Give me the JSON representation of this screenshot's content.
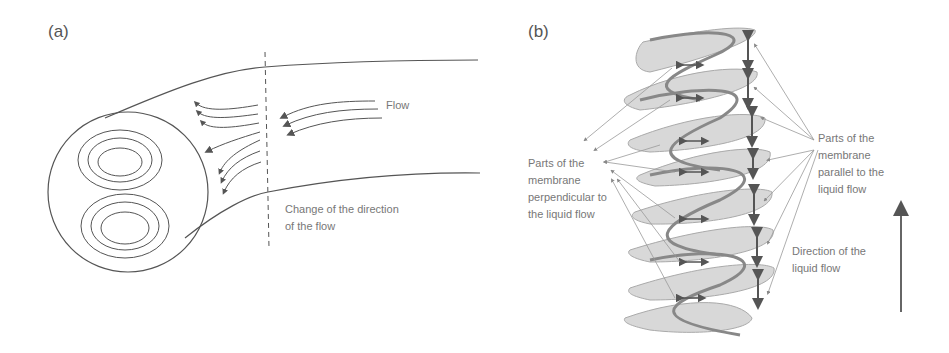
{
  "panels": {
    "a": {
      "label": "(a)",
      "flow_label": "Flow",
      "change_label": "Change of the direction\nof the flow"
    },
    "b": {
      "label": "(b)",
      "perpendicular_label": "Parts of the\nmembrane\nperpendicular to\nthe liquid flow",
      "parallel_label": "Parts of the\nmembrane\nparallel to the\nliquid flow",
      "direction_label": "Direction of the\nliquid flow"
    }
  },
  "colors": {
    "line": "#555555",
    "text": "#777777",
    "ribbon_fill": "#cfcfcf",
    "ribbon_shade": "#9a9a9a"
  }
}
